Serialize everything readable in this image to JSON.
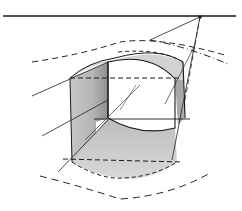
{
  "diagram": {
    "kind": "perspective sketch",
    "elements": [
      "horizon-line",
      "vanishing-point",
      "arched-block",
      "inner-opening",
      "construction-lines",
      "dashed-ground-curves"
    ],
    "colors": {
      "ink": "#1a1a1a",
      "shade_dark": "#9a9a9a",
      "shade_light": "#cfcfcf",
      "background": "#ffffff"
    }
  }
}
